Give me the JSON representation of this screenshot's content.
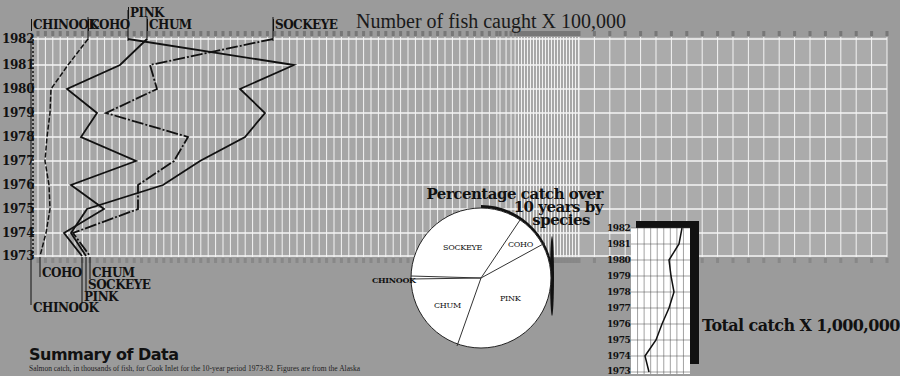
{
  "chart_data": [
    {
      "type": "line",
      "orientation": "horizontal-values-vertical-years",
      "title": "Number of fish caught X 100,000",
      "xlabel": "Number of fish caught X 100,000",
      "ylabel": "Year",
      "y_categories": [
        "1982",
        "1981",
        "1980",
        "1979",
        "1978",
        "1977",
        "1976",
        "1975",
        "1974",
        "1973"
      ],
      "xlim": [
        0,
        280
      ],
      "x_ticks_note": "0–80 compressed region with unit ticks, then 80, 90, 100 … 280 in steps of 10",
      "x_ticks_upper": [
        80,
        90,
        100,
        110,
        120,
        130,
        140,
        150,
        160,
        170,
        180,
        190,
        200,
        210,
        220,
        230,
        240,
        250,
        260,
        270,
        280
      ],
      "grid": true,
      "series": [
        {
          "name": "CHINOOK",
          "style": "dotted",
          "values": [
            0.2,
            0.2,
            0.2,
            0.2,
            0.2,
            0.2,
            0.2,
            0.2,
            0.2,
            0.2
          ]
        },
        {
          "name": "COHO",
          "style": "dashed",
          "values": [
            8,
            5,
            2.5,
            2.4,
            2,
            1.8,
            2.3,
            2.5,
            1.9,
            1
          ]
        },
        {
          "name": "CHUM",
          "style": "solid",
          "values": [
            15.5,
            12,
            4.5,
            8.5,
            6.5,
            13.5,
            5,
            9.5,
            4,
            6.5
          ]
        },
        {
          "name": "SOCKEYE",
          "style": "dash-dot",
          "values": [
            32,
            15.5,
            16.5,
            10,
            22,
            19.5,
            14,
            14,
            5.5,
            7.5
          ]
        },
        {
          "name": "PINK",
          "style": "solid",
          "values": [
            13,
            35,
            27.5,
            31,
            28,
            22,
            17,
            7.5,
            5.5,
            7
          ]
        }
      ]
    },
    {
      "type": "pie",
      "title": "Percentage catch over 10 years by species",
      "categories": [
        "SOCKEYE",
        "COHO",
        "PINK",
        "CHUM",
        "CHINOOK"
      ],
      "values": [
        32,
        7,
        36,
        24,
        1
      ]
    },
    {
      "type": "line",
      "title": "Total catch X 1,000,000",
      "y_categories": [
        "1982",
        "1981",
        "1980",
        "1979",
        "1978",
        "1977",
        "1976",
        "1975",
        "1974",
        "1973"
      ],
      "values": [
        7.6,
        7.4,
        6.4,
        6.6,
        6.9,
        6.4,
        5.6,
        5.0,
        3.3,
        3.8
      ],
      "xlim": [
        0,
        10
      ]
    }
  ],
  "main_chart": {
    "title": "Number of fish caught X 100,000",
    "years": [
      "1982",
      "1981",
      "1980",
      "1979",
      "1978",
      "1977",
      "1976",
      "1975",
      "1974",
      "1973"
    ],
    "top_labels": {
      "chinook": "CHINOOK",
      "coho": "COHO",
      "pink": "PINK",
      "chum": "CHUM",
      "sockeye": "SOCKEYE"
    },
    "bottom_labels": {
      "coho": "COHO",
      "chum": "CHUM",
      "sockeye": "SOCKEYE",
      "pink": "PINK",
      "chinook": "CHINOOK"
    },
    "upper_ticks": [
      "80",
      "90",
      "100",
      "110",
      "120",
      "130",
      "140",
      "150",
      "160",
      "170",
      "180",
      "190",
      "200",
      "210",
      "220",
      "230",
      "240",
      "250",
      "260",
      "270",
      "280"
    ]
  },
  "pie": {
    "title_line1": "Percentage catch over",
    "title_line2": "10 years by",
    "title_line3": "species",
    "labels": {
      "sockeye": "SOCKEYE",
      "coho": "COHO",
      "pink": "PINK",
      "chum": "CHUM",
      "chinook": "CHINOOK"
    }
  },
  "total": {
    "title": "Total catch X 1,000,000",
    "years": [
      "1982",
      "1981",
      "1980",
      "1979",
      "1978",
      "1977",
      "1976",
      "1975",
      "1974",
      "1973"
    ]
  },
  "summary": {
    "heading": "Summary of Data",
    "body": "Salmon catch, in thousands of fish, for Cook Inlet for the 10-year period 1973-82. Figures are from the Alaska"
  },
  "colors": {
    "background": "#9b9b9b",
    "grid_bg": "#a9a9a9",
    "grid_line": "#f2f2f2",
    "ink": "#111111",
    "pie_fill": "#ffffff"
  }
}
